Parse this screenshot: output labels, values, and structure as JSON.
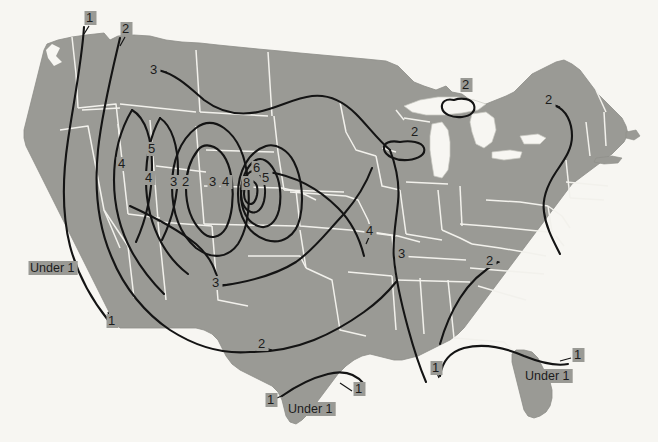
{
  "figure": {
    "kind": "isoline-map",
    "region": "contiguous-united-states",
    "top_clipped_caption": "",
    "colors": {
      "background": "#f7f6f2",
      "land_fill": "#9a9a95",
      "state_border": "#f2f1ec",
      "coast_outline": "#8d8d88",
      "contour_line": "#141414",
      "label_text": "#1c1c1c"
    }
  },
  "chart_data": {
    "type": "contour-map",
    "title": "",
    "units": "",
    "contour_levels": [
      1,
      2,
      3,
      4,
      5,
      6,
      8
    ],
    "min_label": "Under 1",
    "max_label": "8",
    "legend": null,
    "grid": false
  },
  "labels": [
    {
      "id": "nw-1",
      "text": "1",
      "x": 86,
      "y": 22,
      "region": "pacific-northwest"
    },
    {
      "id": "nw-2",
      "text": "2",
      "x": 122,
      "y": 33,
      "region": "pacific-northwest"
    },
    {
      "id": "north-3",
      "text": "3",
      "x": 150,
      "y": 74,
      "region": "northern-rockies"
    },
    {
      "id": "west-4",
      "text": "4",
      "x": 118,
      "y": 168,
      "region": "idaho-utah"
    },
    {
      "id": "west-5",
      "text": "5",
      "x": 148,
      "y": 153,
      "region": "idaho-wyoming"
    },
    {
      "id": "west-4b",
      "text": "4",
      "x": 145,
      "y": 182,
      "region": "utah"
    },
    {
      "id": "core-3a",
      "text": "3",
      "x": 170,
      "y": 186,
      "region": "utah-colorado"
    },
    {
      "id": "core-2",
      "text": "2",
      "x": 182,
      "y": 186,
      "region": "colorado"
    },
    {
      "id": "core-3b",
      "text": "3",
      "x": 209,
      "y": 186,
      "region": "colorado"
    },
    {
      "id": "core-4",
      "text": "4",
      "x": 222,
      "y": 186,
      "region": "colorado"
    },
    {
      "id": "core-8",
      "text": "8",
      "x": 243,
      "y": 187,
      "region": "colorado-peak"
    },
    {
      "id": "core-6",
      "text": "6",
      "x": 253,
      "y": 172,
      "region": "colorado-peak"
    },
    {
      "id": "core-5",
      "text": "5",
      "x": 262,
      "y": 182,
      "region": "colorado-peak"
    },
    {
      "id": "plains-4",
      "text": "4",
      "x": 366,
      "y": 235,
      "region": "kansas-missouri"
    },
    {
      "id": "plains-3",
      "text": "3",
      "x": 398,
      "y": 258,
      "region": "missouri"
    },
    {
      "id": "sw-3",
      "text": "3",
      "x": 212,
      "y": 287,
      "region": "new-mexico"
    },
    {
      "id": "sw-2",
      "text": "2",
      "x": 258,
      "y": 348,
      "region": "west-texas"
    },
    {
      "id": "cal-1",
      "text": "1",
      "x": 108,
      "y": 325,
      "region": "southern-california"
    },
    {
      "id": "cal-under1",
      "text": "Under 1",
      "x": 30,
      "y": 272,
      "region": "california"
    },
    {
      "id": "tx-1a",
      "text": "1",
      "x": 267,
      "y": 404,
      "region": "south-texas"
    },
    {
      "id": "tx-under1",
      "text": "Under 1",
      "x": 288,
      "y": 413,
      "region": "south-texas"
    },
    {
      "id": "tx-1b",
      "text": "1",
      "x": 355,
      "y": 393,
      "region": "gulf-coast-texas"
    },
    {
      "id": "gulf-1",
      "text": "1",
      "x": 432,
      "y": 372,
      "region": "louisiana-coast"
    },
    {
      "id": "se-1",
      "text": "1",
      "x": 574,
      "y": 359,
      "region": "georgia-florida"
    },
    {
      "id": "fl-under1",
      "text": "Under 1",
      "x": 525,
      "y": 380,
      "region": "florida"
    },
    {
      "id": "gl-2a",
      "text": "2",
      "x": 462,
      "y": 89,
      "region": "upper-michigan"
    },
    {
      "id": "gl-2b",
      "text": "2",
      "x": 411,
      "y": 136,
      "region": "wisconsin"
    },
    {
      "id": "ne-2",
      "text": "2",
      "x": 545,
      "y": 104,
      "region": "new-england"
    },
    {
      "id": "se-2",
      "text": "2",
      "x": 486,
      "y": 265,
      "region": "tennessee-carolina"
    }
  ]
}
